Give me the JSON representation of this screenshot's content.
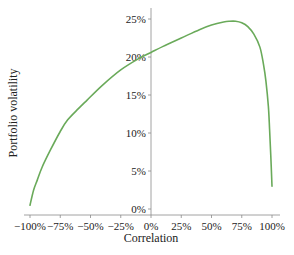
{
  "chart_data": {
    "type": "line",
    "title": "",
    "xlabel": "Correlation",
    "ylabel": "Portfolio volatility",
    "xlim": [
      -100,
      100
    ],
    "ylim": [
      0,
      25
    ],
    "grid": false,
    "legend": null,
    "x_ticks": [
      "-100%",
      "-75%",
      "-50%",
      "-25%",
      "0%",
      "25%",
      "50%",
      "75%",
      "100%"
    ],
    "y_ticks": [
      "0%",
      "5%",
      "10%",
      "15%",
      "20%",
      "25%"
    ],
    "series": [
      {
        "name": "Portfolio volatility",
        "color": "#6aaa5a",
        "x": [
          -100,
          -97,
          -94,
          -90,
          -83,
          -75,
          -69,
          -60,
          -53,
          -40,
          -25,
          -10,
          0,
          10,
          25,
          40,
          50,
          60,
          65,
          70,
          75,
          80,
          85,
          90,
          93,
          95,
          97,
          98,
          99,
          100
        ],
        "values": [
          0.5,
          2.5,
          3.8,
          5.5,
          7.8,
          10.2,
          11.7,
          13.2,
          14.3,
          16.3,
          18.3,
          19.8,
          20.6,
          21.4,
          22.5,
          23.6,
          24.2,
          24.6,
          24.7,
          24.7,
          24.5,
          24.0,
          23.0,
          21.3,
          19.0,
          16.8,
          13.5,
          10.5,
          7.0,
          3.0
        ]
      }
    ]
  }
}
